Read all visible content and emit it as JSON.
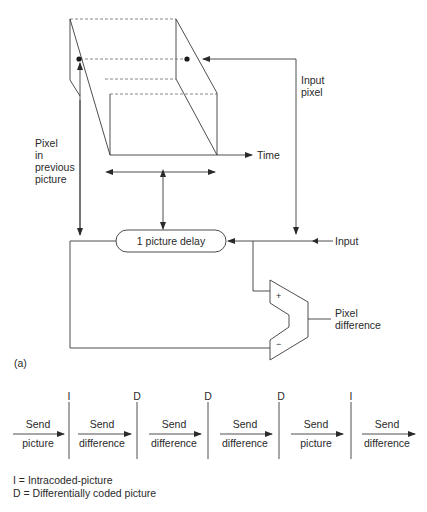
{
  "diagram": {
    "labels": {
      "input_pixel_line1": "Input",
      "input_pixel_line2": "pixel",
      "pixel_prev_line1": "Pixel",
      "pixel_prev_line2": "in",
      "pixel_prev_line3": "previous",
      "pixel_prev_line4": "picture",
      "time": "Time",
      "delay_box": "1 picture delay",
      "input": "Input",
      "plus": "+",
      "minus": "−",
      "pixel_diff_line1": "Pixel",
      "pixel_diff_line2": "difference",
      "figure_tag": "(a)"
    },
    "timeline": {
      "segments": [
        {
          "top": "Send",
          "bottom": "picture"
        },
        {
          "top": "Send",
          "bottom": "difference"
        },
        {
          "top": "Send",
          "bottom": "difference"
        },
        {
          "top": "Send",
          "bottom": "difference"
        },
        {
          "top": "Send",
          "bottom": "picture"
        },
        {
          "top": "Send",
          "bottom": "difference"
        }
      ],
      "markers": [
        "I",
        "D",
        "D",
        "D",
        "I"
      ]
    },
    "legend": {
      "line1": "I = Intracoded-picture",
      "line2": "D = Differentially coded picture"
    },
    "colors": {
      "line": "#3a3a3a",
      "dashed": "#6a6a6a",
      "text": "#2a2a2a",
      "background": "#ffffff"
    }
  }
}
